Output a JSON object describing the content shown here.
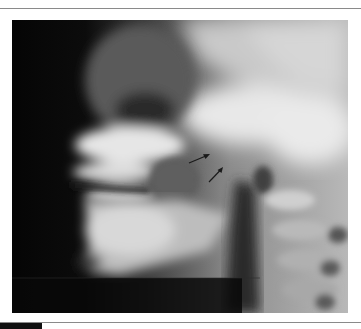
{
  "figure": {
    "type": "lateral radiograph",
    "annotations": [
      {
        "kind": "arrow",
        "from": [
          189,
          163
        ],
        "to": [
          210,
          154
        ]
      },
      {
        "kind": "arrow",
        "from": [
          209,
          182
        ],
        "to": [
          223,
          167
        ]
      }
    ],
    "colors": {
      "background": "#0a0a0a",
      "bone_highlight": "#f0f0f0",
      "soft_tissue": "#9a9a9a",
      "arrow": "#1a1a1a",
      "rule": "#8a8a8a"
    }
  }
}
